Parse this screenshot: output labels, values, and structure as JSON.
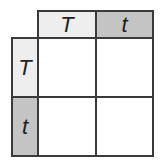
{
  "punnett_square": {
    "columns": [
      {
        "allele": "T",
        "shade": "#eeeeee"
      },
      {
        "allele": "t",
        "shade": "#c4c4c4"
      }
    ],
    "rows": [
      {
        "allele": "T",
        "shade": "#eeeeee"
      },
      {
        "allele": "t",
        "shade": "#c4c4c4"
      }
    ],
    "cells": [
      [
        "",
        ""
      ],
      [
        "",
        ""
      ]
    ]
  }
}
